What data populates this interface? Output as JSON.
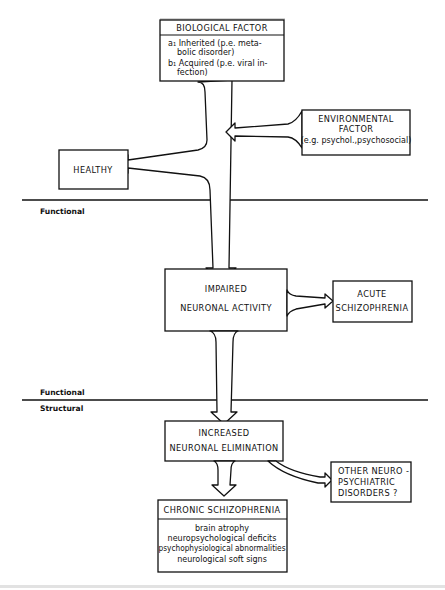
{
  "diagram": {
    "biological": {
      "title": "BIOLOGICAL FACTOR",
      "lines": [
        "a₁ Inherited (p.e. meta-",
        "bolic disorder)",
        "b₁ Acquired (p.e. viral in-",
        "fection)"
      ]
    },
    "environmental": {
      "lines": [
        "ENVIRONMENTAL",
        "FACTOR",
        "(e.g. psychol.,psychosocial)"
      ]
    },
    "healthy": {
      "label": "HEALTHY"
    },
    "impaired": {
      "lines": [
        "IMPAIRED",
        "NEURONAL ACTIVITY"
      ]
    },
    "acute": {
      "lines": [
        "ACUTE",
        "SCHIZOPHRENIA"
      ]
    },
    "increased": {
      "lines": [
        "INCREASED",
        "NEURONAL ELIMINATION"
      ]
    },
    "other": {
      "lines": [
        "OTHER NEURO -",
        "PSYCHIATRIC",
        "DISORDERS ?"
      ]
    },
    "chronic": {
      "title": "CHRONIC SCHIZOPHRENIA",
      "lines": [
        "brain atrophy",
        "neuropsychological deficits",
        "psychophysiological abnormalities",
        "neurological soft signs"
      ]
    },
    "levels": {
      "functional_1": "Functional",
      "functional_2": "Functional",
      "structural": "Structural"
    }
  }
}
